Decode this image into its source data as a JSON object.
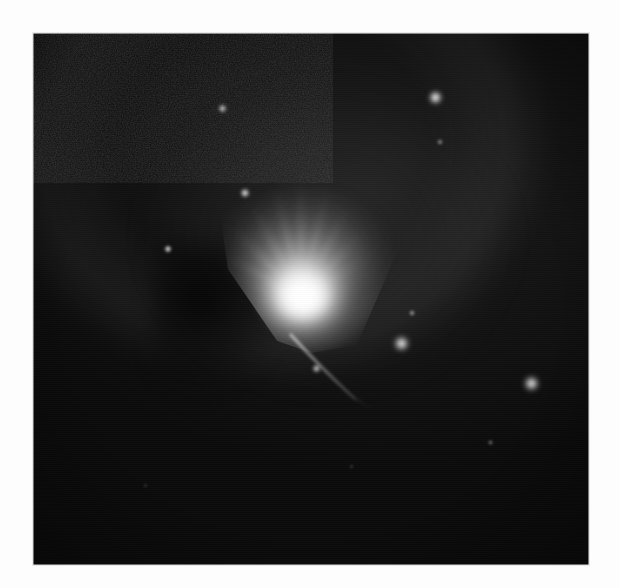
{
  "page": {
    "background_color": "#fdfdfd",
    "width": 620,
    "height": 588,
    "scan_ghost_text": ""
  },
  "plate": {
    "name": "astronomical-plate",
    "left": 33,
    "top": 33,
    "width": 556,
    "height": 532,
    "sky_color": "#0a0a0a",
    "border_color": "#e9e9e9",
    "caption": ""
  },
  "chart_data": {
    "type": "scatter",
    "title": "",
    "subtitle": "",
    "xlabel": "",
    "ylabel": "",
    "grid": false,
    "legend_position": "none",
    "xlim": [
      0,
      556
    ],
    "ylim": [
      0,
      532
    ],
    "background_color": "#0a0a0a",
    "objects": [
      {
        "id": "nebula-core",
        "kind": "nebula",
        "label": "reflection nebula fan",
        "x": 240,
        "y": 255,
        "size": 190,
        "brightness": 1.0,
        "color": "#ffffff",
        "shape": "fan"
      },
      {
        "id": "dust-lane",
        "kind": "dust",
        "label": "dark dust lane",
        "x": 185,
        "y": 290,
        "size": 150,
        "brightness": 0.0,
        "color": "#000000",
        "shape": "lane"
      },
      {
        "id": "jet",
        "kind": "filament",
        "label": "faint curved jet filament",
        "x": 295,
        "y": 335,
        "size": 90,
        "brightness": 0.22,
        "color": "#c8c8c8",
        "shape": "arc"
      },
      {
        "id": "halo-arc",
        "kind": "halo",
        "label": "diffuse outer arc",
        "x": 215,
        "y": 80,
        "size": 520,
        "brightness": 0.07,
        "color": "#bebebe",
        "shape": "arc"
      }
    ],
    "stars": [
      {
        "id": "star-1",
        "label": "bright field star NE",
        "x": 402,
        "y": 64,
        "size": 17,
        "brightness": 0.95
      },
      {
        "id": "star-2",
        "label": "faint star below NE star",
        "x": 407,
        "y": 109,
        "size": 8,
        "brightness": 0.42
      },
      {
        "id": "star-3",
        "label": "field star N",
        "x": 189,
        "y": 75,
        "size": 11,
        "brightness": 0.72
      },
      {
        "id": "star-4",
        "label": "star on nebula plume",
        "x": 212,
        "y": 160,
        "size": 12,
        "brightness": 0.8
      },
      {
        "id": "star-5",
        "label": "field star W",
        "x": 135,
        "y": 216,
        "size": 10,
        "brightness": 0.74
      },
      {
        "id": "star-6",
        "label": "faint star SE of core",
        "x": 379,
        "y": 280,
        "size": 8,
        "brightness": 0.48
      },
      {
        "id": "star-7",
        "label": "bright field star SE",
        "x": 368,
        "y": 310,
        "size": 19,
        "brightness": 0.92
      },
      {
        "id": "star-8",
        "label": "field star S of core",
        "x": 283,
        "y": 335,
        "size": 11,
        "brightness": 0.7
      },
      {
        "id": "star-9",
        "label": "bright field star E",
        "x": 498,
        "y": 350,
        "size": 19,
        "brightness": 0.9
      },
      {
        "id": "star-10",
        "label": "faint star SE corner",
        "x": 457,
        "y": 409,
        "size": 7,
        "brightness": 0.35
      },
      {
        "id": "star-11",
        "label": "very faint star S",
        "x": 318,
        "y": 433,
        "size": 5,
        "brightness": 0.22
      },
      {
        "id": "star-12",
        "label": "very faint star SW",
        "x": 112,
        "y": 452,
        "size": 5,
        "brightness": 0.2
      }
    ],
    "streaks": [
      {
        "id": "streak-1",
        "angle": -152,
        "length": 86,
        "brightness": 0.5
      },
      {
        "id": "streak-2",
        "angle": -135,
        "length": 96,
        "brightness": 0.55
      },
      {
        "id": "streak-3",
        "angle": -118,
        "length": 104,
        "brightness": 0.58
      },
      {
        "id": "streak-4",
        "angle": -103,
        "length": 112,
        "brightness": 0.62
      },
      {
        "id": "streak-5",
        "angle": -90,
        "length": 118,
        "brightness": 0.6
      },
      {
        "id": "streak-6",
        "angle": -76,
        "length": 112,
        "brightness": 0.58
      },
      {
        "id": "streak-7",
        "angle": -62,
        "length": 100,
        "brightness": 0.52
      },
      {
        "id": "streak-8",
        "angle": -46,
        "length": 88,
        "brightness": 0.45
      },
      {
        "id": "streak-9",
        "angle": -30,
        "length": 70,
        "brightness": 0.35
      },
      {
        "id": "streak-10",
        "angle": -166,
        "length": 62,
        "brightness": 0.3
      }
    ]
  }
}
